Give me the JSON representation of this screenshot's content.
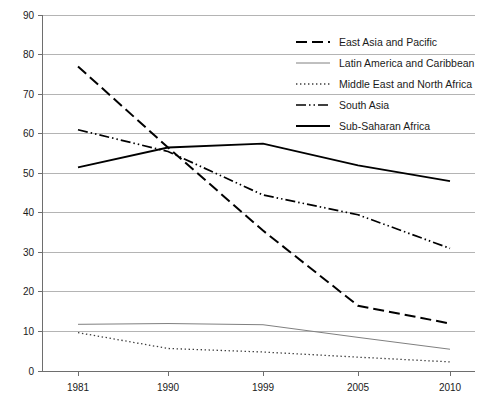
{
  "chart_data": {
    "type": "line",
    "title": "",
    "subtitle": "",
    "xlabel": "",
    "ylabel": "",
    "categories": [
      "1981",
      "1990",
      "1999",
      "2005",
      "2010"
    ],
    "x": [
      1981,
      1990,
      1999,
      2005,
      2010
    ],
    "ylim": [
      0,
      90
    ],
    "yticks": [
      0,
      10,
      20,
      30,
      40,
      50,
      60,
      70,
      80,
      90
    ],
    "ytick_labels": [
      "0",
      "10",
      "20",
      "30",
      "40",
      "50",
      "60",
      "70",
      "80",
      "90"
    ],
    "grid": true,
    "grid_axis": "y",
    "legend_position": "upper-right-inside",
    "series": [
      {
        "name": "East Asia and Pacific",
        "values": [
          77.0,
          56.5,
          35.5,
          16.5,
          12.0
        ],
        "style": "dashed",
        "color": "#000000",
        "width": 2.0
      },
      {
        "name": "Latin America and Caribbean",
        "values": [
          11.8,
          12.0,
          11.7,
          8.5,
          5.5
        ],
        "style": "solid-thin",
        "color": "#808080",
        "width": 1.0
      },
      {
        "name": "Middle East and North Africa",
        "values": [
          9.7,
          5.7,
          4.8,
          3.5,
          2.3
        ],
        "style": "dotted",
        "color": "#3c3c3c",
        "width": 1.3
      },
      {
        "name": "South Asia",
        "values": [
          61.0,
          55.5,
          44.5,
          39.5,
          31.0
        ],
        "style": "dash-dot-dot",
        "color": "#000000",
        "width": 1.7
      },
      {
        "name": "Sub-Saharan Africa",
        "values": [
          51.5,
          56.5,
          57.5,
          52.0,
          48.0
        ],
        "style": "solid",
        "color": "#000000",
        "width": 1.8
      }
    ]
  },
  "legend": {
    "entries": [
      {
        "label": "East Asia and Pacific"
      },
      {
        "label": "Latin America and Caribbean"
      },
      {
        "label": "Middle East and North Africa"
      },
      {
        "label": "South Asia"
      },
      {
        "label": "Sub-Saharan Africa"
      }
    ]
  },
  "axes": {
    "y_labels": [
      "90",
      "80",
      "70",
      "60",
      "50",
      "40",
      "30",
      "20",
      "10",
      "0"
    ],
    "x_labels": [
      "1981",
      "1990",
      "1999",
      "2005",
      "2010"
    ]
  }
}
